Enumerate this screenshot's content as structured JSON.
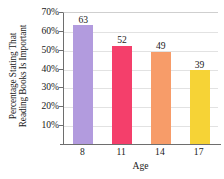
{
  "chart_data": {
    "type": "bar",
    "title": "",
    "categories": [
      "8",
      "11",
      "14",
      "17"
    ],
    "values": [
      63,
      52,
      49,
      39
    ],
    "value_labels": [
      "63",
      "52",
      "49",
      "39"
    ],
    "bar_colors": [
      "#B29BDE",
      "#F43F6B",
      "#F79C69",
      "#F6D336"
    ],
    "xlabel": "Age",
    "ylabel_line1": "Percentage Stating That",
    "ylabel_line2": "Reading Books Is Important",
    "ylim": [
      0,
      70
    ],
    "ytick_values": [
      10,
      20,
      30,
      40,
      50,
      60,
      70
    ],
    "ytick_labels": [
      "10%",
      "20%",
      "30%",
      "40%",
      "50%",
      "60%",
      "70%"
    ],
    "grid": true,
    "grid_axis": "y",
    "legend": "none",
    "axis_color": "#6e6e6e",
    "grid_color": "#e2e2e2",
    "background": "#ffffff"
  }
}
